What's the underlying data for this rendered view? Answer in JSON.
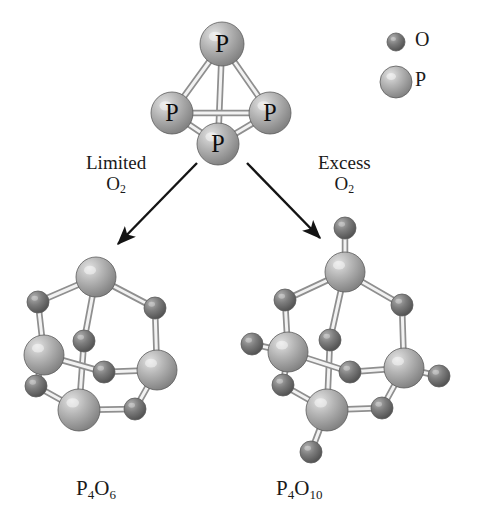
{
  "figure": {
    "kind": "molecular-structure-diagram",
    "background": "#ffffff"
  },
  "legend": {
    "items": [
      {
        "symbol": "O",
        "name": "oxygen",
        "radius": 9,
        "color": "#6e6e6e",
        "highlight": "#a8a8a8",
        "cx": 396,
        "cy": 42
      },
      {
        "symbol": "P",
        "name": "phosphorus",
        "radius": 16,
        "color": "#a9a9a9",
        "highlight": "#d8d8d8",
        "cx": 396,
        "cy": 82
      }
    ]
  },
  "arrows": [
    {
      "name": "limited-o2-arrow",
      "label_line1": "Limited",
      "label_line2": "O",
      "label_sub": "2",
      "x1": 197,
      "y1": 163,
      "x2": 118,
      "y2": 244
    },
    {
      "name": "excess-o2-arrow",
      "label_line1": "Excess",
      "label_line2": "O",
      "label_sub": "2",
      "x1": 247,
      "y1": 163,
      "x2": 320,
      "y2": 238
    }
  ],
  "captions": {
    "left_formula": {
      "base1": "P",
      "sub1": "4",
      "base2": "O",
      "sub2": "6"
    },
    "right_formula": {
      "base1": "P",
      "sub1": "4",
      "base2": "O",
      "sub2": "10"
    }
  },
  "molecules": [
    {
      "name": "p4-tetrahedron",
      "formula": "P4",
      "atoms": [
        {
          "el": "P",
          "x": 222,
          "y": 44,
          "r": 22,
          "label": "P"
        },
        {
          "el": "P",
          "x": 172,
          "y": 113,
          "r": 21,
          "label": "P"
        },
        {
          "el": "P",
          "x": 270,
          "y": 113,
          "r": 21,
          "label": "P"
        },
        {
          "el": "P",
          "x": 218,
          "y": 144,
          "r": 21,
          "label": "P"
        }
      ],
      "bonds": [
        [
          0,
          1
        ],
        [
          0,
          2
        ],
        [
          0,
          3
        ],
        [
          1,
          2
        ],
        [
          1,
          3
        ],
        [
          2,
          3
        ]
      ]
    },
    {
      "name": "p4o6-cage",
      "formula": "P4O6",
      "atoms": [
        {
          "el": "P",
          "x": 96,
          "y": 277,
          "r": 20
        },
        {
          "el": "P",
          "x": 44,
          "y": 355,
          "r": 20
        },
        {
          "el": "P",
          "x": 157,
          "y": 370,
          "r": 20
        },
        {
          "el": "P",
          "x": 79,
          "y": 410,
          "r": 21
        },
        {
          "el": "O",
          "x": 38,
          "y": 302,
          "r": 11
        },
        {
          "el": "O",
          "x": 155,
          "y": 308,
          "r": 11
        },
        {
          "el": "O",
          "x": 84,
          "y": 341,
          "r": 11
        },
        {
          "el": "O",
          "x": 104,
          "y": 372,
          "r": 11
        },
        {
          "el": "O",
          "x": 36,
          "y": 386,
          "r": 11
        },
        {
          "el": "O",
          "x": 135,
          "y": 409,
          "r": 11
        }
      ],
      "bonds": [
        [
          0,
          4
        ],
        [
          4,
          1
        ],
        [
          0,
          5
        ],
        [
          5,
          2
        ],
        [
          0,
          6
        ],
        [
          6,
          3
        ],
        [
          1,
          7
        ],
        [
          7,
          2
        ],
        [
          1,
          8
        ],
        [
          8,
          3
        ],
        [
          2,
          9
        ],
        [
          9,
          3
        ]
      ]
    },
    {
      "name": "p4o10-cage",
      "formula": "P4O10",
      "atoms": [
        {
          "el": "P",
          "x": 345,
          "y": 272,
          "r": 20
        },
        {
          "el": "P",
          "x": 288,
          "y": 352,
          "r": 20
        },
        {
          "el": "P",
          "x": 404,
          "y": 368,
          "r": 20
        },
        {
          "el": "P",
          "x": 327,
          "y": 410,
          "r": 21
        },
        {
          "el": "O",
          "x": 285,
          "y": 300,
          "r": 11
        },
        {
          "el": "O",
          "x": 402,
          "y": 305,
          "r": 11
        },
        {
          "el": "O",
          "x": 330,
          "y": 340,
          "r": 11
        },
        {
          "el": "O",
          "x": 350,
          "y": 372,
          "r": 11
        },
        {
          "el": "O",
          "x": 283,
          "y": 385,
          "r": 11
        },
        {
          "el": "O",
          "x": 382,
          "y": 408,
          "r": 11
        },
        {
          "el": "O",
          "x": 345,
          "y": 228,
          "r": 11
        },
        {
          "el": "O",
          "x": 252,
          "y": 344,
          "r": 11
        },
        {
          "el": "O",
          "x": 439,
          "y": 376,
          "r": 11
        },
        {
          "el": "O",
          "x": 311,
          "y": 452,
          "r": 11
        }
      ],
      "bonds": [
        [
          0,
          4
        ],
        [
          4,
          1
        ],
        [
          0,
          5
        ],
        [
          5,
          2
        ],
        [
          0,
          6
        ],
        [
          6,
          3
        ],
        [
          1,
          7
        ],
        [
          7,
          2
        ],
        [
          1,
          8
        ],
        [
          8,
          3
        ],
        [
          2,
          9
        ],
        [
          9,
          3
        ],
        [
          0,
          10
        ],
        [
          1,
          11
        ],
        [
          2,
          12
        ],
        [
          3,
          13
        ]
      ]
    }
  ]
}
